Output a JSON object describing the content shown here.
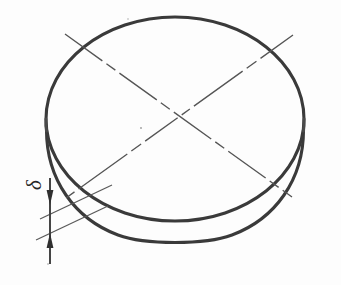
{
  "drawing": {
    "title": "Circular disc with thickness dimension",
    "subject": "disc",
    "projection": "oblique-isometric",
    "background_color": "#fdfdfd",
    "line_color": "#3a3a3a",
    "thin_line_color": "#555555"
  },
  "annotations": {
    "thickness_symbol": "δ",
    "thickness_symbol_name": "delta",
    "thickness_symbol_rotation_deg": -90
  },
  "geometry": {
    "top_face": {
      "name": "top-ellipse",
      "cx": 175,
      "cy": 120,
      "rx": 129,
      "ry": 103
    },
    "bottom_face": {
      "name": "bottom-ellipse",
      "cx": 175,
      "cy": 136,
      "rx": 129,
      "ry": 103
    },
    "thickness_px": 16,
    "centerlines": [
      {
        "name": "centerline-a",
        "x1": 65,
        "y1": 34,
        "x2": 292,
        "y2": 197
      },
      {
        "name": "centerline-b",
        "x1": 293,
        "y1": 35,
        "x2": 66,
        "y2": 198
      }
    ],
    "dimension": {
      "name": "thickness-dimension",
      "line_x": 50,
      "line_y_top": 180,
      "line_y_bottom": 262,
      "arrow_upper_y": 196,
      "arrow_lower_y": 243,
      "extension_upper": {
        "x1": 46,
        "y1": 216,
        "x2": 108,
        "y2": 186
      },
      "extension_lower": {
        "x1": 42,
        "y1": 237,
        "x2": 104,
        "y2": 207
      }
    }
  },
  "labels": {
    "delta": "δ"
  }
}
